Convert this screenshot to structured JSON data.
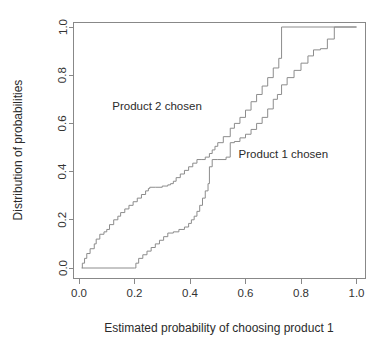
{
  "chart_data": {
    "type": "line",
    "subtype": "ecdf-step",
    "title": "",
    "xlabel": "Estimated probability of choosing product 1",
    "ylabel": "Distribution of probabilities",
    "xlim": [
      -0.02,
      1.04
    ],
    "ylim": [
      -0.03,
      1.04
    ],
    "xticks": [
      0.0,
      0.2,
      0.4,
      0.6,
      0.8,
      1.0
    ],
    "xticklabels": [
      "0.0",
      "0.2",
      "0.4",
      "0.6",
      "0.8",
      "1.0"
    ],
    "yticks": [
      0.0,
      0.2,
      0.4,
      0.6,
      0.8,
      1.0
    ],
    "yticklabels": [
      "0.0",
      "0.2",
      "0.4",
      "0.6",
      "0.8",
      "1.0"
    ],
    "grid": false,
    "legend_position": "inline-annotations",
    "line_color": "#8c8c8c",
    "series": [
      {
        "name": "Product 2 chosen",
        "annotation": "Product 2 chosen",
        "annotation_x": 0.12,
        "annotation_y": 0.655,
        "x": [
          0.01,
          0.012,
          0.02,
          0.028,
          0.04,
          0.055,
          0.062,
          0.075,
          0.09,
          0.1,
          0.11,
          0.125,
          0.14,
          0.15,
          0.165,
          0.18,
          0.195,
          0.21,
          0.225,
          0.24,
          0.25,
          0.255,
          0.275,
          0.3,
          0.32,
          0.33,
          0.34,
          0.35,
          0.365,
          0.38,
          0.395,
          0.41,
          0.425,
          0.44,
          0.455,
          0.47,
          0.48,
          0.49,
          0.5,
          0.52,
          0.545,
          0.56,
          0.58,
          0.6,
          0.62,
          0.64,
          0.66,
          0.68,
          0.7,
          0.72,
          0.73
        ],
        "y": [
          0.0,
          0.02,
          0.04,
          0.06,
          0.08,
          0.1,
          0.12,
          0.14,
          0.15,
          0.16,
          0.18,
          0.2,
          0.215,
          0.23,
          0.245,
          0.26,
          0.275,
          0.29,
          0.305,
          0.32,
          0.33,
          0.335,
          0.335,
          0.34,
          0.345,
          0.35,
          0.36,
          0.375,
          0.39,
          0.405,
          0.42,
          0.435,
          0.45,
          0.45,
          0.46,
          0.475,
          0.49,
          0.505,
          0.52,
          0.545,
          0.58,
          0.6,
          0.625,
          0.655,
          0.69,
          0.72,
          0.755,
          0.79,
          0.83,
          0.87,
          1.0
        ]
      },
      {
        "name": "Product 1 chosen",
        "annotation": "Product 1 chosen",
        "annotation_x": 0.575,
        "annotation_y": 0.455,
        "x": [
          0.01,
          0.2,
          0.205,
          0.215,
          0.23,
          0.245,
          0.26,
          0.275,
          0.29,
          0.305,
          0.32,
          0.34,
          0.36,
          0.38,
          0.395,
          0.405,
          0.415,
          0.425,
          0.435,
          0.445,
          0.455,
          0.465,
          0.47,
          0.48,
          0.5,
          0.53,
          0.545,
          0.56,
          0.58,
          0.6,
          0.62,
          0.64,
          0.66,
          0.68,
          0.7,
          0.715,
          0.73,
          0.75,
          0.775,
          0.8,
          0.825,
          0.845,
          0.87,
          0.895,
          0.92
        ],
        "y": [
          0.0,
          0.0,
          0.02,
          0.04,
          0.055,
          0.07,
          0.085,
          0.1,
          0.115,
          0.13,
          0.145,
          0.15,
          0.16,
          0.17,
          0.185,
          0.2,
          0.215,
          0.235,
          0.26,
          0.29,
          0.32,
          0.35,
          0.42,
          0.45,
          0.45,
          0.46,
          0.52,
          0.525,
          0.54,
          0.555,
          0.575,
          0.6,
          0.625,
          0.66,
          0.7,
          0.72,
          0.76,
          0.79,
          0.82,
          0.85,
          0.88,
          0.905,
          0.91,
          0.95,
          1.0
        ]
      }
    ]
  },
  "axes": {
    "x_title": "Estimated probability of choosing product 1",
    "y_title": "Distribution of probabilities",
    "x_tick_labels": [
      "0.0",
      "0.2",
      "0.4",
      "0.6",
      "0.8",
      "1.0"
    ],
    "y_tick_labels": [
      "0.0",
      "0.2",
      "0.4",
      "0.6",
      "0.8",
      "1.0"
    ]
  },
  "annotations": {
    "left_curve_label": "Product 2 chosen",
    "right_curve_label": "Product 1 chosen"
  }
}
